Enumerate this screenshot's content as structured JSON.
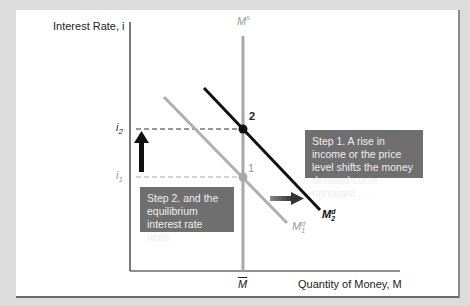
{
  "diagram": {
    "y_axis_label": "Interest Rate, i",
    "x_axis_label": "Quantity of Money, M",
    "supply_label": "M",
    "supply_sup": "s",
    "m_bar_label": "M",
    "i2_label": "i",
    "i2_sub": "2",
    "i1_label": "i",
    "i1_sub": "1",
    "point2_label": "2",
    "point1_label": "1",
    "md1_label": "M",
    "md1_sup": "d",
    "md1_sub": "1",
    "md2_label": "M",
    "md2_sup": "d",
    "md2_sub": "2",
    "step1_text": "Step 1. A rise in income or the price level shifts the money demand curve rightward . . .",
    "step2_text": "Step 2. and the equilibrium interest rate rises.",
    "colors": {
      "background": "#dcdcdc",
      "panel": "#ffffff",
      "md2_line": "#111111",
      "md1_line": "#b0b0b0",
      "supply_line": "#a8a8a8",
      "step_box": "#6f6f6f",
      "step_text": "#eeeeee"
    }
  }
}
